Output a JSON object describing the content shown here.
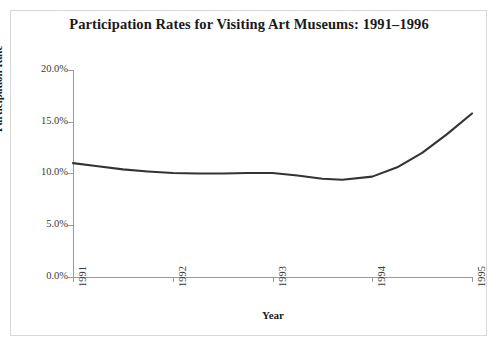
{
  "chart_data": {
    "type": "line",
    "title": "Participation Rates for Visiting Art Museums: 1991–1996",
    "xlabel": "Year",
    "ylabel": "Participation Rate",
    "xlim": [
      1991,
      1995
    ],
    "ylim": [
      0,
      20
    ],
    "grid": false,
    "legend": "none",
    "y_ticks": [
      "0.0%",
      "5.0%",
      "10.0%",
      "15.0%",
      "20.0%"
    ],
    "y_tick_values": [
      0,
      5,
      10,
      15,
      20
    ],
    "x_ticks": [
      "1991",
      "1992",
      "1993",
      "1994",
      "1995"
    ],
    "x_tick_values": [
      1991,
      1992,
      1993,
      1994,
      1995
    ],
    "series": [
      {
        "name": "Participation Rate",
        "color": "#333333",
        "x": [
          1991.0,
          1991.25,
          1991.5,
          1991.75,
          1992.0,
          1992.25,
          1992.5,
          1992.75,
          1993.0,
          1993.25,
          1993.5,
          1993.7,
          1994.0,
          1994.25,
          1994.5,
          1994.75,
          1995.0
        ],
        "values": [
          11.0,
          10.7,
          10.4,
          10.2,
          10.05,
          10.0,
          10.0,
          10.05,
          10.05,
          9.8,
          9.5,
          9.4,
          9.7,
          10.6,
          12.0,
          13.8,
          15.8
        ]
      }
    ]
  },
  "chart": {
    "title": "Participation Rates for Visiting Art Museums: 1991–1996",
    "x_axis_title": "Year",
    "y_axis_title": "Participation Rate",
    "y_labels": [
      "20.0%",
      "15.0%",
      "10.0%",
      "5.0%",
      "0.0%"
    ],
    "x_labels": [
      "1991",
      "1992",
      "1993",
      "1994",
      "1995"
    ],
    "line_color": "#333333",
    "axis_color": "#9a9a9a",
    "frame_color": "#d8d8d8",
    "background_color": "#ffffff"
  }
}
